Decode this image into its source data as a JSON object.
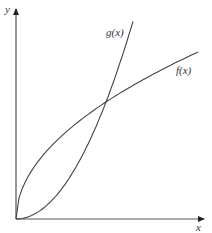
{
  "chart_data": {
    "type": "line",
    "title": "",
    "xlabel": "x",
    "ylabel": "y",
    "grid": false,
    "legend": "none",
    "ticks": "none",
    "series": [
      {
        "name": "f(x)",
        "shape": "concave, square-root-like",
        "label": "f(x)",
        "x": [
          0,
          0.1,
          0.25,
          0.5,
          0.75,
          1.0
        ],
        "y": [
          0,
          0.32,
          0.5,
          0.71,
          0.87,
          1.0
        ]
      },
      {
        "name": "g(x)",
        "shape": "convex, parabola-like",
        "label": "g(x)",
        "x": [
          0,
          0.1,
          0.25,
          0.5,
          0.64
        ],
        "y": [
          0,
          0.02,
          0.12,
          0.47,
          1.18
        ]
      }
    ],
    "annotations": [
      "curves intersect once at approx x=0.49, y=0.70 (relative to f endpoint)"
    ],
    "colors": {
      "axes": "#333333",
      "curves": "#444444"
    }
  },
  "labels": {
    "x_axis": "x",
    "y_axis": "y",
    "f": "f(x)",
    "g": "g(x)"
  }
}
